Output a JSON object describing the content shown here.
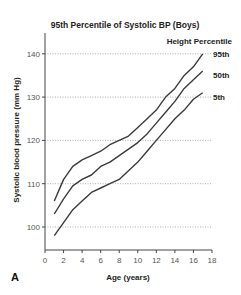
{
  "chart_data": {
    "type": "line",
    "title": "95th Percentile of Systolic BP (Boys)",
    "xlabel": "Age (years)",
    "ylabel": "Systolic blood pressure (mm Hg)",
    "xlim": [
      0,
      18
    ],
    "ylim": [
      95,
      145
    ],
    "xticks": [
      0,
      2,
      4,
      6,
      8,
      10,
      12,
      14,
      16,
      18
    ],
    "yticks": [
      100,
      110,
      120,
      130,
      140
    ],
    "grid": "horizontal dotted",
    "legend_title": "Height Percentile",
    "legend_position": "right",
    "panel_label": "A",
    "x": [
      1,
      2,
      3,
      4,
      5,
      6,
      7,
      8,
      9,
      10,
      11,
      12,
      13,
      14,
      15,
      16,
      17
    ],
    "series": [
      {
        "name": "95th",
        "values": [
          106,
          111,
          114,
          115.5,
          116.5,
          117.5,
          119,
          120,
          121,
          123,
          125,
          127,
          130,
          132,
          135,
          137,
          140
        ]
      },
      {
        "name": "50th",
        "values": [
          103,
          106.5,
          109.5,
          111,
          112,
          114,
          115,
          116.5,
          118,
          119.5,
          121.5,
          124,
          126.5,
          129,
          132,
          134,
          136
        ]
      },
      {
        "name": "5th",
        "values": [
          98,
          101,
          104,
          106,
          108,
          109,
          110,
          111,
          113,
          115,
          117.5,
          120,
          122.5,
          125,
          127,
          129.5,
          131
        ]
      }
    ]
  }
}
